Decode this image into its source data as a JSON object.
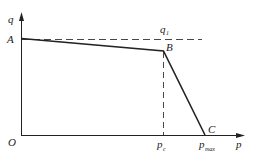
{
  "diagram": {
    "axes": {
      "y_label": "q",
      "x_label": "p",
      "origin_label": "O"
    },
    "points": {
      "A": "A",
      "B": "B",
      "C": "C"
    },
    "reference_line_label": "q",
    "reference_line_sub": "1",
    "x_ticks": {
      "pc_main": "p",
      "pc_sub": "c",
      "pmax_main": "p",
      "pmax_sub": "max"
    },
    "colors": {
      "line": "#222222",
      "background": "#ffffff"
    }
  }
}
